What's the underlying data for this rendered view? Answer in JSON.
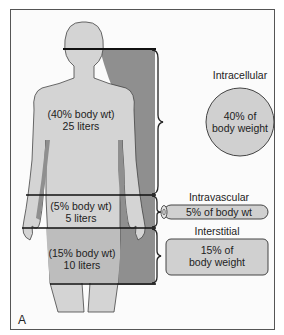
{
  "figure_label": "A",
  "body_labels": {
    "intracellular": {
      "line1": "(40% body wt)",
      "line2": "25 liters"
    },
    "intravascular": {
      "line1": "(5% body wt)",
      "line2": "5 liters"
    },
    "interstitial": {
      "line1": "(15% body wt)",
      "line2": "10 liters"
    }
  },
  "compartments": {
    "intracellular": {
      "title": "Intracellular",
      "line1": "40% of",
      "line2": "body weight"
    },
    "intravascular": {
      "title": "Intravascular",
      "line1": "5% of body wt"
    },
    "interstitial": {
      "title": "Interstitial",
      "line1": "15% of",
      "line2": "body weight"
    }
  },
  "colors": {
    "body_fill": "#d4d4d4",
    "shadow_fill": "#8f8f8f",
    "interstitial_fill": "#bdbdbd",
    "compartment_fill": "#d0d0d0",
    "outline": "#444444"
  }
}
